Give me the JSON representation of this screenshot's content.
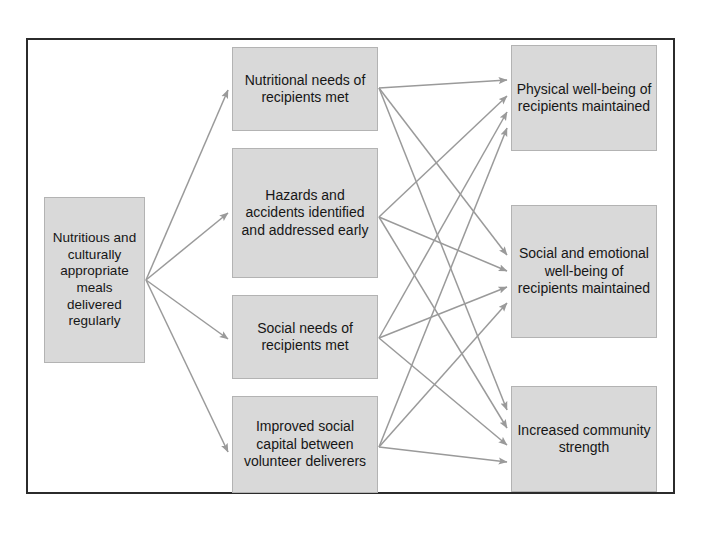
{
  "diagram": {
    "type": "logic-model-flowchart",
    "title_visible": false,
    "colors": {
      "node_fill": "#d9d9d9",
      "node_border": "#b3b3b3",
      "edge": "#9a9a9a",
      "frame_border": "#2b2b2b",
      "text": "#161616",
      "background": "#ffffff"
    },
    "input_nodes": [
      {
        "id": "input",
        "label": "Nutritious and culturally appropriate meals delivered regularly"
      }
    ],
    "output_nodes": [
      {
        "id": "out-1",
        "label": "Nutritional needs of recipients met"
      },
      {
        "id": "out-2",
        "label": "Hazards and accidents identified and addressed early"
      },
      {
        "id": "out-3",
        "label": "Social needs of recipients met"
      },
      {
        "id": "out-4",
        "label": "Improved social capital between volunteer deliverers"
      }
    ],
    "outcome_nodes": [
      {
        "id": "outcome-1",
        "label": "Physical well-being of recipients maintained"
      },
      {
        "id": "outcome-2",
        "label": "Social and emotional well-being of recipients maintained"
      },
      {
        "id": "outcome-3",
        "label": "Increased community strength"
      }
    ],
    "edges": [
      {
        "from": "input",
        "to": "out-1"
      },
      {
        "from": "input",
        "to": "out-2"
      },
      {
        "from": "input",
        "to": "out-3"
      },
      {
        "from": "input",
        "to": "out-4"
      },
      {
        "from": "out-1",
        "to": "outcome-1"
      },
      {
        "from": "out-1",
        "to": "outcome-2"
      },
      {
        "from": "out-1",
        "to": "outcome-3"
      },
      {
        "from": "out-2",
        "to": "outcome-1"
      },
      {
        "from": "out-2",
        "to": "outcome-2"
      },
      {
        "from": "out-2",
        "to": "outcome-3"
      },
      {
        "from": "out-3",
        "to": "outcome-1"
      },
      {
        "from": "out-3",
        "to": "outcome-2"
      },
      {
        "from": "out-3",
        "to": "outcome-3"
      },
      {
        "from": "out-4",
        "to": "outcome-1"
      },
      {
        "from": "out-4",
        "to": "outcome-2"
      },
      {
        "from": "out-4",
        "to": "outcome-3"
      }
    ]
  }
}
